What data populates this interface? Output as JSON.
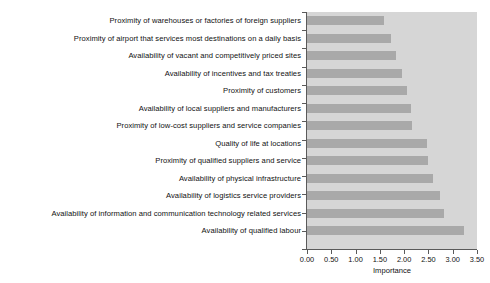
{
  "chart_data": {
    "type": "bar",
    "orientation": "horizontal",
    "title": "",
    "xlabel": "Importance",
    "ylabel": "",
    "xlim": [
      0.0,
      3.5
    ],
    "grid": false,
    "legend": null,
    "bar_color": "#a9a9a9",
    "plot_background": "#d6d6d6",
    "figure_background": "#ffffff",
    "xticks": [
      "0.00",
      "0.50",
      "1.00",
      "1.50",
      "2.00",
      "2.50",
      "3.00",
      "3.50"
    ],
    "xtick_values": [
      0.0,
      0.5,
      1.0,
      1.5,
      2.0,
      2.5,
      3.0,
      3.5
    ],
    "categories": [
      "Proximity of warehouses or factories of foreign suppliers",
      "Proximity of airport that services most destinations on a daily basis",
      "Availability of vacant and competitively priced sites",
      "Availability of incentives and tax treaties",
      "Proximity of customers",
      "Availability of local suppliers and manufacturers",
      "Proximity of low-cost suppliers and service companies",
      "Quality of life at locations",
      "Proximity of qualified suppliers and service",
      "Availability of physical infrastructure",
      "Availability of logistics service providers",
      "Availability of information and communication technology related services",
      "Availability of qualified labour"
    ],
    "values": [
      1.58,
      1.73,
      1.83,
      1.96,
      2.06,
      2.15,
      2.17,
      2.48,
      2.5,
      2.6,
      2.73,
      2.83,
      3.23
    ]
  }
}
